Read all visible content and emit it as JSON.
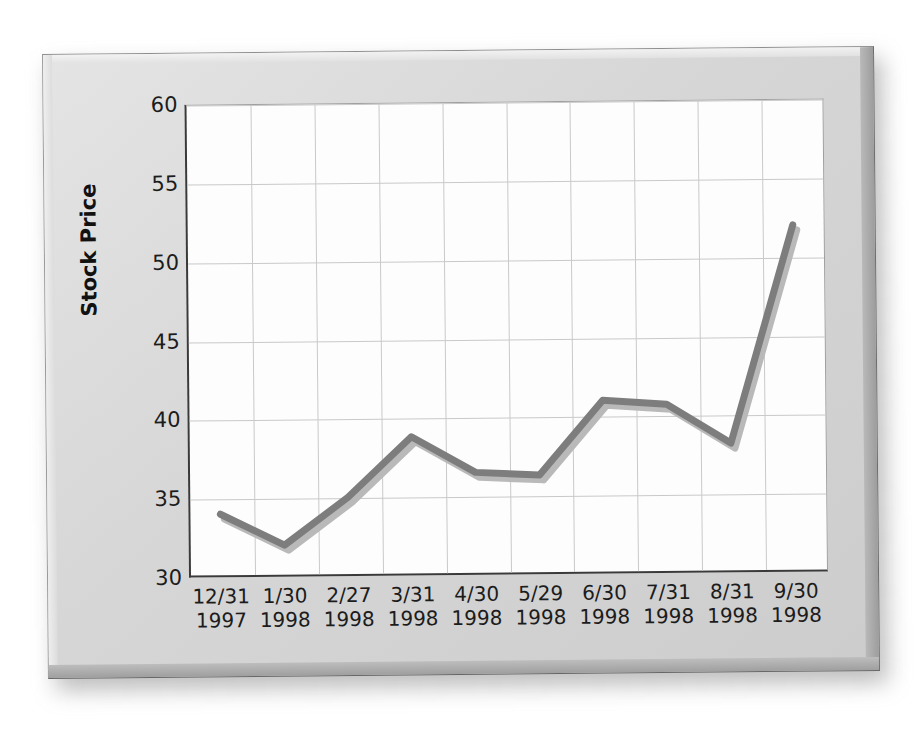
{
  "chart_data": {
    "type": "line",
    "title": "",
    "subtitle": "",
    "xlabel": "",
    "ylabel": "Stock Price",
    "ylim": [
      30,
      60
    ],
    "yticks": [
      30,
      35,
      40,
      45,
      50,
      55,
      60
    ],
    "ytick_labels": [
      "30",
      "35",
      "40",
      "45",
      "50",
      "55",
      "60"
    ],
    "grid": true,
    "legend": "none",
    "categories": [
      "12/31 1997",
      "1/30 1998",
      "2/27 1998",
      "3/31 1998",
      "4/30 1998",
      "5/29 1998",
      "6/30 1998",
      "7/31 1998",
      "8/31 1998",
      "9/30 1998"
    ],
    "category_lines": [
      {
        "date": "12/31",
        "year": "1997"
      },
      {
        "date": "1/30",
        "year": "1998"
      },
      {
        "date": "2/27",
        "year": "1998"
      },
      {
        "date": "3/31",
        "year": "1998"
      },
      {
        "date": "4/30",
        "year": "1998"
      },
      {
        "date": "5/29",
        "year": "1998"
      },
      {
        "date": "6/30",
        "year": "1998"
      },
      {
        "date": "7/31",
        "year": "1998"
      },
      {
        "date": "8/31",
        "year": "1998"
      },
      {
        "date": "9/30",
        "year": "1998"
      }
    ],
    "values": [
      34,
      32,
      35,
      38.8,
      36.5,
      36.3,
      41,
      40.7,
      38.2,
      52
    ],
    "series": [
      {
        "name": "Stock Price",
        "values": [
          34,
          32,
          35,
          38.8,
          36.5,
          36.3,
          41,
          40.7,
          38.2,
          52
        ]
      }
    ],
    "colors": {
      "line": "#7d7d7d",
      "line_shadow": "#b9b9b9",
      "grid": "#c9c9c9",
      "axis": "#3a3a3a",
      "plot_background": "#fdfdfd",
      "plaque": "#d6d6d6",
      "page_background": "#ffffff",
      "text": "#1c1c1c"
    },
    "line_width": 7
  }
}
